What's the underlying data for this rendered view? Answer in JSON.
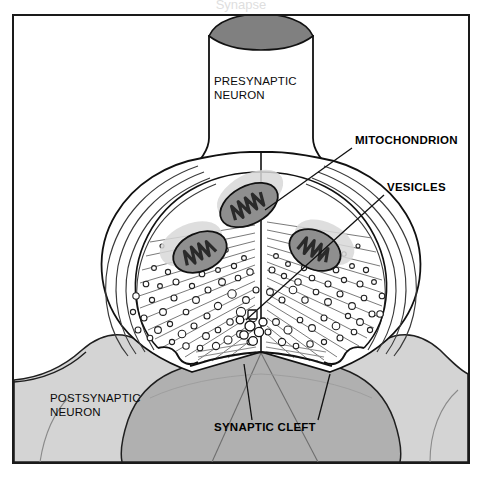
{
  "figure": {
    "kind": "biology-diagram",
    "title_cropped": "Synapse",
    "background_color": "#ffffff",
    "frame": {
      "x": 13,
      "y": 15,
      "width": 456,
      "height": 448,
      "stroke_color": "#1a1a1a",
      "stroke_width": 2,
      "fill_color": "#ffffff"
    }
  },
  "palette": {
    "outline": "#111111",
    "axon_cut_face": "#808080",
    "presynaptic_fill": "#ffffff",
    "postsynaptic_fill": "#d4d4d4",
    "postsynaptic_terminal_fill": "#b0b0b0",
    "mitochondrion_body": "#8f8f8f",
    "mitochondrion_cristae": "#2a2a2a",
    "mitochondrion_halo": "#d8d8d8",
    "vesicle_stroke": "#222222",
    "vesicle_fill": "#ffffff",
    "fiber_line": "#5a5a5a"
  },
  "labels": [
    {
      "id": "presynaptic-neuron",
      "lines": [
        "PRESYNAPTIC",
        "NEURON"
      ],
      "weight": "regular",
      "anchor": "start",
      "x": 214,
      "y": 85,
      "leader": false
    },
    {
      "id": "mitochondrion",
      "lines": [
        "MITOCHONDRION"
      ],
      "weight": "bold",
      "anchor": "start",
      "x": 355,
      "y": 144,
      "leader": true,
      "leader_path": "M 352 148 L 265 210"
    },
    {
      "id": "vesicles",
      "lines": [
        "VESICLES"
      ],
      "weight": "bold",
      "anchor": "start",
      "x": 387,
      "y": 191,
      "leader": true,
      "leader_path": "M 384 195 L 246 320"
    },
    {
      "id": "postsynaptic-neuron",
      "lines": [
        "POSTSYNAPTIC",
        "NEURON"
      ],
      "weight": "regular",
      "anchor": "start",
      "x": 50,
      "y": 402,
      "leader": false
    },
    {
      "id": "synaptic-cleft",
      "lines": [
        "SYNAPTIC CLEFT"
      ],
      "weight": "bold",
      "anchor": "start",
      "x": 214,
      "y": 431,
      "leader": true,
      "leader_path": "M 252 420 L 244 364"
    }
  ],
  "structures": {
    "axon_shaft": {
      "name": "presynaptic axon shaft",
      "cut_ellipse": {
        "cx": 261,
        "cy": 36,
        "rx": 52,
        "ry": 12
      }
    },
    "terminal_bulb": {
      "name": "presynaptic terminal bouton",
      "description": "bulbous axon terminal containing mitochondria and vesicles"
    },
    "mitochondria": [
      {
        "id": "mito-center",
        "cx": 249,
        "cy": 205,
        "rx": 31,
        "ry": 19,
        "rotation": -28
      },
      {
        "id": "mito-left",
        "cx": 200,
        "cy": 252,
        "rx": 28,
        "ry": 19,
        "rotation": -24
      },
      {
        "id": "mito-right",
        "cx": 315,
        "cy": 250,
        "rx": 27,
        "ry": 19,
        "rotation": 27
      }
    ],
    "vesicle_count": 96,
    "cleft": {
      "name": "synaptic cleft",
      "description": "narrow gap between presynaptic membrane and postsynaptic membrane"
    }
  }
}
